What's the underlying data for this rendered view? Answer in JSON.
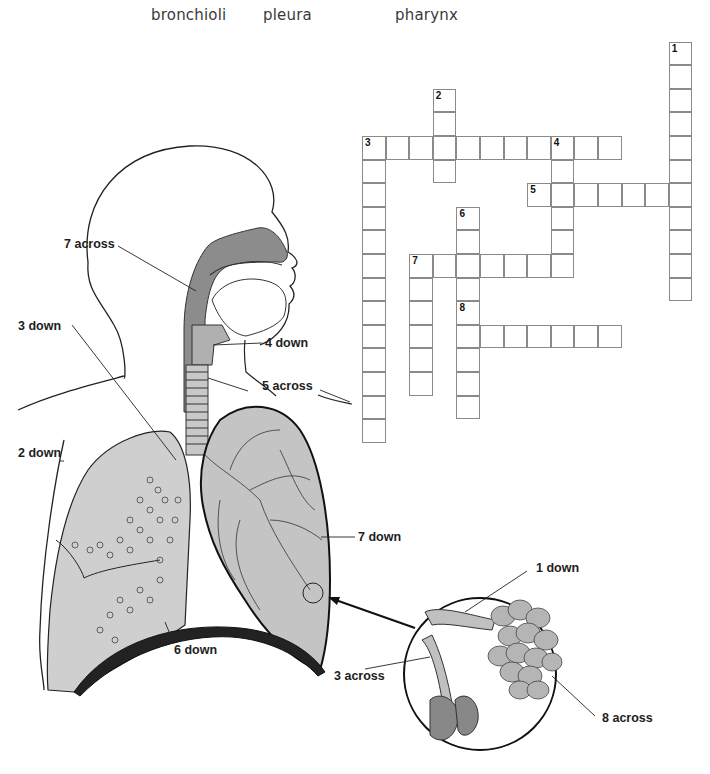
{
  "word_bank": {
    "words": [
      "bronchioli",
      "pleura",
      "pharynx"
    ]
  },
  "crossword": {
    "cell_size": 23.6,
    "origin": {
      "x": 362,
      "y": 136
    },
    "entries": [
      {
        "number": "1",
        "direction": "down",
        "row": -4,
        "col": 13,
        "length": 11
      },
      {
        "number": "2",
        "direction": "down",
        "row": -2,
        "col": 3,
        "length": 4
      },
      {
        "number": "3",
        "direction": "across",
        "row": 0,
        "col": 0,
        "length": 11
      },
      {
        "number": "3",
        "direction": "down",
        "row": 0,
        "col": 0,
        "length": 13
      },
      {
        "number": "4",
        "direction": "down",
        "row": 0,
        "col": 8,
        "length": 6
      },
      {
        "number": "5",
        "direction": "across",
        "row": 2,
        "col": 7,
        "length": 7
      },
      {
        "number": "6",
        "direction": "down",
        "row": 3,
        "col": 4,
        "length": 9
      },
      {
        "number": "7",
        "direction": "across",
        "row": 5,
        "col": 2,
        "length": 7
      },
      {
        "number": "7",
        "direction": "down",
        "row": 5,
        "col": 2,
        "length": 6
      },
      {
        "number": "8",
        "direction": "across",
        "row": 8,
        "col": 4,
        "length": 7
      }
    ],
    "numbers": [
      {
        "label": "1",
        "row": -4,
        "col": 13
      },
      {
        "label": "2",
        "row": -2,
        "col": 3
      },
      {
        "label": "3",
        "row": 0,
        "col": 0
      },
      {
        "label": "4",
        "row": 0,
        "col": 8
      },
      {
        "label": "5",
        "row": 2,
        "col": 7
      },
      {
        "label": "6",
        "row": 3,
        "col": 4
      },
      {
        "label": "7",
        "row": 5,
        "col": 2
      },
      {
        "label": "8",
        "row": 7,
        "col": 4
      }
    ]
  },
  "diagram": {
    "labels": {
      "seven_across": "7 across",
      "three_down": "3 down",
      "four_down": "4 down",
      "five_across": "5 across",
      "two_down": "2 down",
      "seven_down": "7 down",
      "six_down": "6 down",
      "one_down": "1 down",
      "three_across": "3 across",
      "eight_across": "8 across"
    },
    "colors": {
      "airway": "#8c8c8c",
      "lung": "#c9c9c9",
      "lung_light": "#dedede",
      "outline": "#1a1a1a",
      "alveoli": "#b5b5b5"
    }
  }
}
